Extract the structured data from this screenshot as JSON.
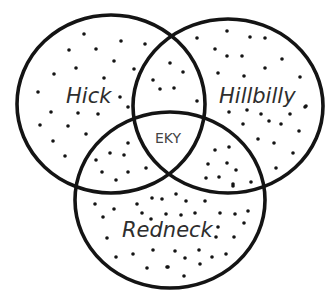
{
  "diagram": {
    "type": "venn",
    "colors": {
      "stroke": "#141414",
      "label": "#2e2e2e",
      "center_label": "#444444",
      "background": "#ffffff"
    },
    "sets": [
      {
        "id": "hick",
        "label": "Hick",
        "cx": 111,
        "cy": 104,
        "rx": 94,
        "ry": 89,
        "label_x": 66,
        "label_y": 103
      },
      {
        "id": "hillbilly",
        "label": "Hillbilly",
        "cx": 228,
        "cy": 106,
        "rx": 95,
        "ry": 87,
        "label_x": 219,
        "label_y": 103
      },
      {
        "id": "redneck",
        "label": "Redneck",
        "cx": 170,
        "cy": 200,
        "rx": 95,
        "ry": 88,
        "label_x": 122,
        "label_y": 237
      }
    ],
    "intersection": {
      "label": "EKY",
      "x": 155,
      "y": 143
    }
  },
  "dots": [
    [
      84,
      34
    ],
    [
      121,
      41
    ],
    [
      69,
      50
    ],
    [
      96,
      49
    ],
    [
      114,
      61
    ],
    [
      76,
      68
    ],
    [
      54,
      74
    ],
    [
      104,
      78
    ],
    [
      134,
      69
    ],
    [
      38,
      92
    ],
    [
      120,
      97
    ],
    [
      51,
      112
    ],
    [
      78,
      113
    ],
    [
      98,
      114
    ],
    [
      128,
      107
    ],
    [
      40,
      125
    ],
    [
      68,
      126
    ],
    [
      86,
      134
    ],
    [
      53,
      141
    ],
    [
      65,
      156
    ],
    [
      128,
      143
    ],
    [
      110,
      153
    ],
    [
      124,
      155
    ],
    [
      96,
      160
    ],
    [
      102,
      172
    ],
    [
      128,
      172
    ],
    [
      146,
      168
    ],
    [
      116,
      180
    ],
    [
      145,
      44
    ],
    [
      197,
      38
    ],
    [
      170,
      63
    ],
    [
      183,
      72
    ],
    [
      153,
      80
    ],
    [
      160,
      89
    ],
    [
      174,
      88
    ],
    [
      197,
      101
    ],
    [
      227,
      31
    ],
    [
      250,
      37
    ],
    [
      265,
      38
    ],
    [
      215,
      49
    ],
    [
      227,
      56
    ],
    [
      242,
      56
    ],
    [
      282,
      59
    ],
    [
      265,
      68
    ],
    [
      218,
      73
    ],
    [
      244,
      76
    ],
    [
      300,
      77
    ],
    [
      305,
      107
    ],
    [
      306,
      106
    ],
    [
      229,
      112
    ],
    [
      247,
      110
    ],
    [
      261,
      114
    ],
    [
      290,
      114
    ],
    [
      243,
      124
    ],
    [
      269,
      121
    ],
    [
      281,
      124
    ],
    [
      299,
      131
    ],
    [
      258,
      139
    ],
    [
      274,
      143
    ],
    [
      293,
      153
    ],
    [
      276,
      168
    ],
    [
      215,
      150
    ],
    [
      229,
      147
    ],
    [
      208,
      164
    ],
    [
      227,
      163
    ],
    [
      236,
      170
    ],
    [
      206,
      178
    ],
    [
      219,
      177
    ],
    [
      233,
      184
    ],
    [
      251,
      182
    ],
    [
      95,
      204
    ],
    [
      114,
      209
    ],
    [
      103,
      217
    ],
    [
      137,
      204
    ],
    [
      152,
      198
    ],
    [
      162,
      199
    ],
    [
      142,
      213
    ],
    [
      151,
      219
    ],
    [
      166,
      214
    ],
    [
      107,
      238
    ],
    [
      116,
      257
    ],
    [
      133,
      254
    ],
    [
      153,
      250
    ],
    [
      147,
      268
    ],
    [
      167,
      267
    ],
    [
      176,
      194
    ],
    [
      186,
      201
    ],
    [
      205,
      201
    ],
    [
      233,
      186
    ],
    [
      181,
      215
    ],
    [
      195,
      213
    ],
    [
      220,
      213
    ],
    [
      235,
      214
    ],
    [
      248,
      211
    ],
    [
      244,
      223
    ],
    [
      218,
      227
    ],
    [
      216,
      237
    ],
    [
      234,
      237
    ],
    [
      175,
      251
    ],
    [
      185,
      258
    ],
    [
      199,
      250
    ],
    [
      212,
      257
    ],
    [
      226,
      254
    ],
    [
      200,
      264
    ],
    [
      168,
      267
    ],
    [
      184,
      276
    ]
  ]
}
